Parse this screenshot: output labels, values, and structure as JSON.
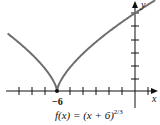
{
  "chart_data": {
    "type": "line",
    "title": "",
    "caption": "f(x) = (x + 6)^(2/3)",
    "function": "(x+6)^(2/3)",
    "xlabel": "x",
    "ylabel": "y",
    "x_tick_labels": [
      "-6"
    ],
    "marked_point": {
      "x": -6,
      "y": 0
    },
    "xlim": [
      -10.2,
      1.5
    ],
    "ylim": [
      -0.6,
      3.8
    ],
    "grid": false,
    "series": [
      {
        "name": "f(x)",
        "x": [
          -9.7,
          -9,
          -8,
          -7,
          -6,
          -5,
          -4,
          -3,
          -2,
          -1,
          0,
          1
        ],
        "y": [
          2.39,
          2.08,
          1.59,
          1.0,
          0,
          1.0,
          1.59,
          2.08,
          2.52,
          2.92,
          3.3,
          3.66
        ]
      }
    ]
  },
  "labels": {
    "caption_main": "f(x) = (x + 6)",
    "caption_exp": "2/3",
    "x_tick": "−6",
    "x_axis": "x",
    "y_axis": "y"
  },
  "colors": {
    "curve": "#6e6e6e",
    "axis": "#111111"
  }
}
